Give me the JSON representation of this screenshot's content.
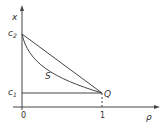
{
  "diagram": {
    "type": "phase-diagram",
    "axes": {
      "x_label": "ρ",
      "y_label": "x",
      "x_ticks": [
        "0",
        "1"
      ]
    },
    "points": {
      "c2": {
        "label": "c",
        "sub": "2"
      },
      "c1": {
        "label": "c",
        "sub": "1"
      },
      "Q": {
        "label": "Q"
      }
    },
    "curves": {
      "S": {
        "label": "S"
      }
    },
    "colors": {
      "line": "#444444",
      "text": "#333333",
      "background": "#ffffff"
    }
  }
}
